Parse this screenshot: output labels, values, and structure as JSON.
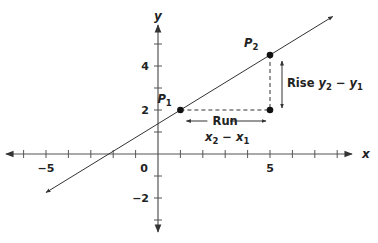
{
  "chart_data": {
    "type": "line",
    "title": "",
    "xlabel": "x",
    "ylabel": "y",
    "xlim": [
      -6.5,
      8
    ],
    "ylim": [
      -3.5,
      5.5
    ],
    "x_ticks": [
      -6,
      -5,
      -4,
      -3,
      -2,
      -1,
      1,
      2,
      3,
      4,
      5,
      6,
      7,
      8
    ],
    "y_ticks": [
      -3,
      -2,
      -1,
      1,
      2,
      3,
      4,
      5
    ],
    "x_tick_labels": [
      {
        "value": -5,
        "text": "−5"
      },
      {
        "value": 5,
        "text": "5"
      }
    ],
    "y_tick_labels": [
      {
        "value": 4,
        "text": "4"
      },
      {
        "value": 2,
        "text": "2"
      },
      {
        "value": -2,
        "text": "−2"
      }
    ],
    "origin_label": "0",
    "grid": false,
    "line": {
      "slope": 0.625,
      "intercept": 1.375,
      "x_start": -5,
      "x_end": 7.8
    },
    "points": [
      {
        "name": "P",
        "sub": "1",
        "x": 1,
        "y": 2
      },
      {
        "name": "P",
        "sub": "2",
        "x": 5,
        "y": 4.5
      }
    ],
    "corner": {
      "x": 5,
      "y": 2
    },
    "annotations": {
      "run_label": "Run",
      "run_formula": {
        "a": "x",
        "a_sub": "2",
        "op": " − ",
        "b": "x",
        "b_sub": "1"
      },
      "rise_label": "Rise",
      "rise_formula": {
        "a": "y",
        "a_sub": "2",
        "op": " − ",
        "b": "y",
        "b_sub": "1"
      }
    }
  }
}
